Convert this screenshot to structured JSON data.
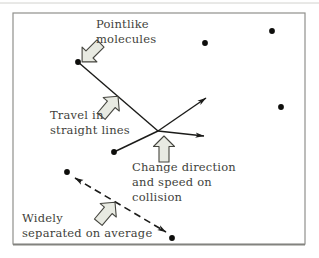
{
  "figure": {
    "width": 319,
    "height": 258,
    "background": "#ffffff",
    "colors": {
      "frame": "#90908c",
      "frame_bottom": "#83837f",
      "page_edge": "#d2d2ce",
      "line": "#1b1b19",
      "dot": "#0e0e0c",
      "block_arrow_fill": "#e8eae2",
      "block_arrow_stroke": "#45453f",
      "text": "#3f3f3b"
    },
    "frame": {
      "x": 13,
      "y": 13,
      "w": 292,
      "h": 231
    }
  },
  "labels": [
    {
      "id": "pointlike-molecules",
      "text": "Pointlike\nmolecules",
      "x": 96,
      "y": 17
    },
    {
      "id": "travel-straight-lines",
      "text": "Travel in\nstraight lines",
      "x": 50,
      "y": 108
    },
    {
      "id": "change-direction",
      "text": "Change direction\nand speed on\ncollision",
      "x": 132,
      "y": 160
    },
    {
      "id": "widely-separated",
      "text": "Widely\nseparated on average",
      "x": 22,
      "y": 211
    }
  ],
  "molecules": [
    {
      "x": 78,
      "y": 62
    },
    {
      "x": 205,
      "y": 43
    },
    {
      "x": 272,
      "y": 31
    },
    {
      "x": 281,
      "y": 107
    },
    {
      "x": 114,
      "y": 152
    },
    {
      "x": 67,
      "y": 172
    },
    {
      "x": 172,
      "y": 238
    }
  ],
  "paths": {
    "incoming": [
      {
        "x1": 78,
        "y1": 62,
        "x2": 158,
        "y2": 131
      },
      {
        "x1": 114,
        "y1": 152,
        "x2": 158,
        "y2": 131
      }
    ],
    "outgoing": [
      {
        "x1": 158,
        "y1": 131,
        "x2": 206,
        "y2": 98
      },
      {
        "x1": 158,
        "y1": 131,
        "x2": 204,
        "y2": 136
      }
    ],
    "separation": {
      "x1": 75,
      "y1": 178,
      "x2": 166,
      "y2": 232,
      "dash": "7 4.5"
    }
  },
  "block_arrows": [
    {
      "cx": 92,
      "cy": 52,
      "angle": 225
    },
    {
      "cx": 109,
      "cy": 107,
      "angle": 40
    },
    {
      "cx": 164,
      "cy": 150,
      "angle": 0
    },
    {
      "cx": 106,
      "cy": 213,
      "angle": 40
    }
  ]
}
